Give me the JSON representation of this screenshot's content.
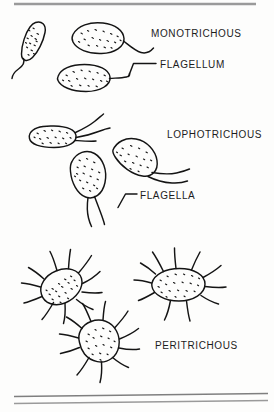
{
  "figure": {
    "background_color": "#fdfdfc",
    "ink_color": "#141414",
    "rule_color": "#8a8a8a",
    "labels": {
      "monotrichous": "MONOTRICHOUS",
      "flagellum": "FLAGELLUM",
      "lophotrichous": "LOPHOTRICHOUS",
      "flagella": "FLAGELLA",
      "peritrichous": "PERITRICHOUS"
    },
    "rules": [
      {
        "name": "top-rule",
        "x1": 14,
        "y1": 4,
        "x2": 256,
        "y2": 4,
        "width": 2.2
      },
      {
        "name": "bottom-rule-upper",
        "x1": 14,
        "y1": 396,
        "x2": 268,
        "y2": 393,
        "width": 1.4
      },
      {
        "name": "bottom-rule-lower",
        "x1": 14,
        "y1": 403,
        "x2": 268,
        "y2": 400,
        "width": 1.4
      }
    ],
    "groups": [
      {
        "name": "monotrichous-group",
        "label": "MONOTRICHOUS",
        "description": "Single polar flagellum",
        "cell_count": 3,
        "flagella_per_cell": 1
      },
      {
        "name": "lophotrichous-group",
        "label": "LOPHOTRICHOUS",
        "description": "Tuft of flagella at one pole",
        "cell_count": 3,
        "flagella_per_cell": 2
      },
      {
        "name": "peritrichous-group",
        "label": "PERITRICHOUS",
        "description": "Flagella distributed over entire surface",
        "cell_count": 3,
        "flagella_per_cell": 8
      }
    ],
    "leader_lines": [
      {
        "name": "flagellum-leader",
        "points": "129,76 134,63 156,63"
      },
      {
        "name": "flagella-leader",
        "points": "118,207 126,194 137,194"
      }
    ]
  }
}
